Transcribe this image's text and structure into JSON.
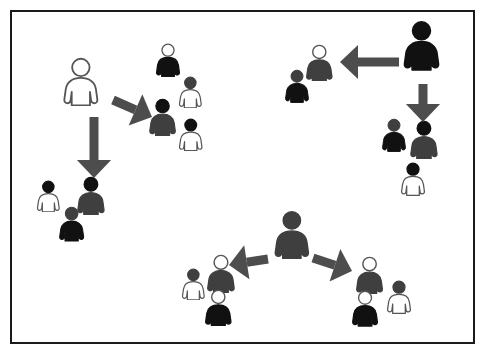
{
  "figure": {
    "canvas": {
      "width": 485,
      "height": 356,
      "background": "#ffffff"
    },
    "frame": {
      "label": "diagram-border",
      "x": 10,
      "y": 10,
      "width": 465,
      "height": 334,
      "border_color": "#1a1a1a",
      "border_width": 2,
      "fill": "#ffffff"
    },
    "palette": {
      "black": "#111111",
      "dark_gray": "#3f3f3f",
      "mid_gray": "#555555",
      "white_fill": "#ffffff",
      "outline": "#555555",
      "arrow": "#4d4d4d"
    },
    "legend_note": "Person icons vary by head color and body color: black, gray, or white (outlined).",
    "people": [
      {
        "id": "p01",
        "name": "hub-person-top-left",
        "group": "top-left-hub",
        "x": 62,
        "y": 57,
        "scale": 1.45,
        "head": "white",
        "body": "white",
        "role": "hub"
      },
      {
        "id": "p02",
        "name": "person-top-mid-a",
        "group": "top-mid-cluster",
        "x": 155,
        "y": 43,
        "scale": 1.0,
        "head": "white",
        "body": "black",
        "role": "member"
      },
      {
        "id": "p03",
        "name": "person-top-mid-b",
        "group": "top-mid-cluster",
        "x": 178,
        "y": 76,
        "scale": 0.95,
        "head": "gray",
        "body": "white",
        "role": "member"
      },
      {
        "id": "p04",
        "name": "person-top-mid-c",
        "group": "top-mid-cluster",
        "x": 148,
        "y": 98,
        "scale": 1.12,
        "head": "black",
        "body": "gray",
        "role": "member"
      },
      {
        "id": "p05",
        "name": "person-top-mid-d",
        "group": "top-mid-cluster",
        "x": 178,
        "y": 118,
        "scale": 0.98,
        "head": "black",
        "body": "white",
        "role": "member"
      },
      {
        "id": "p06",
        "name": "person-left-low-a",
        "group": "left-low-cluster",
        "x": 36,
        "y": 180,
        "scale": 0.95,
        "head": "black",
        "body": "white",
        "role": "member"
      },
      {
        "id": "p07",
        "name": "person-left-low-b",
        "group": "left-low-cluster",
        "x": 76,
        "y": 176,
        "scale": 1.15,
        "head": "black",
        "body": "gray",
        "role": "member"
      },
      {
        "id": "p08",
        "name": "person-left-low-c",
        "group": "left-low-cluster",
        "x": 58,
        "y": 206,
        "scale": 1.05,
        "head": "gray",
        "body": "black",
        "role": "member"
      },
      {
        "id": "p09",
        "name": "hub-person-top-right",
        "group": "top-right-hub",
        "x": 402,
        "y": 20,
        "scale": 1.5,
        "head": "black",
        "body": "black",
        "role": "hub"
      },
      {
        "id": "p10",
        "name": "person-top-right-a",
        "group": "top-right-cluster",
        "x": 305,
        "y": 44,
        "scale": 1.1,
        "head": "white",
        "body": "gray",
        "role": "member"
      },
      {
        "id": "p11",
        "name": "person-top-right-b",
        "group": "top-right-cluster",
        "x": 284,
        "y": 69,
        "scale": 1.0,
        "head": "gray",
        "body": "black",
        "role": "member"
      },
      {
        "id": "p12",
        "name": "person-right-mid-a",
        "group": "right-mid-cluster",
        "x": 381,
        "y": 118,
        "scale": 1.0,
        "head": "gray",
        "body": "black",
        "role": "member"
      },
      {
        "id": "p13",
        "name": "person-right-mid-b",
        "group": "right-mid-cluster",
        "x": 409,
        "y": 120,
        "scale": 1.15,
        "head": "black",
        "body": "gray",
        "role": "member"
      },
      {
        "id": "p14",
        "name": "person-right-mid-c",
        "group": "right-mid-cluster",
        "x": 400,
        "y": 162,
        "scale": 1.0,
        "head": "black",
        "body": "white",
        "role": "member"
      },
      {
        "id": "p15",
        "name": "hub-person-bottom-center",
        "group": "bottom-center-hub",
        "x": 273,
        "y": 210,
        "scale": 1.45,
        "head": "gray",
        "body": "gray",
        "role": "hub"
      },
      {
        "id": "p16",
        "name": "person-bottom-left-a",
        "group": "bottom-left-cluster",
        "x": 181,
        "y": 268,
        "scale": 0.95,
        "head": "gray",
        "body": "white",
        "role": "member"
      },
      {
        "id": "p17",
        "name": "person-bottom-left-b",
        "group": "bottom-left-cluster",
        "x": 206,
        "y": 254,
        "scale": 1.15,
        "head": "white",
        "body": "gray",
        "role": "member"
      },
      {
        "id": "p18",
        "name": "person-bottom-left-c",
        "group": "bottom-left-cluster",
        "x": 204,
        "y": 289,
        "scale": 1.1,
        "head": "white",
        "body": "black",
        "role": "member"
      },
      {
        "id": "p19",
        "name": "person-bottom-right-a",
        "group": "bottom-right-cluster",
        "x": 355,
        "y": 256,
        "scale": 1.12,
        "head": "white",
        "body": "gray",
        "role": "member"
      },
      {
        "id": "p20",
        "name": "person-bottom-right-b",
        "group": "bottom-right-cluster",
        "x": 386,
        "y": 280,
        "scale": 1.0,
        "head": "gray",
        "body": "white",
        "role": "member"
      },
      {
        "id": "p21",
        "name": "person-bottom-right-c",
        "group": "bottom-right-cluster",
        "x": 351,
        "y": 290,
        "scale": 1.08,
        "head": "white",
        "body": "black",
        "role": "member"
      }
    ],
    "arrows": [
      {
        "id": "a1",
        "name": "arrow-top-left-to-top-mid",
        "from": "hub-person-top-left",
        "to": "top-mid-cluster",
        "x1": 113,
        "y1": 100,
        "x2": 152,
        "y2": 117,
        "width": 9,
        "head": 18,
        "direction": "down-right"
      },
      {
        "id": "a2",
        "name": "arrow-top-left-to-left-low",
        "from": "hub-person-top-left",
        "to": "left-low-cluster",
        "x1": 94,
        "y1": 117,
        "x2": 94,
        "y2": 178,
        "width": 9,
        "head": 18,
        "direction": "down"
      },
      {
        "id": "a3",
        "name": "arrow-top-right-to-top-right-cluster",
        "from": "hub-person-top-right",
        "to": "top-right-cluster",
        "x1": 399,
        "y1": 62,
        "x2": 340,
        "y2": 62,
        "width": 9,
        "head": 18,
        "direction": "left"
      },
      {
        "id": "a4",
        "name": "arrow-top-right-to-right-mid",
        "from": "hub-person-top-right",
        "to": "right-mid-cluster",
        "x1": 423,
        "y1": 84,
        "x2": 423,
        "y2": 122,
        "width": 9,
        "head": 18,
        "direction": "down"
      },
      {
        "id": "a5",
        "name": "arrow-bottom-center-to-bottom-left",
        "from": "hub-person-bottom-center",
        "to": "bottom-left-cluster",
        "x1": 268,
        "y1": 259,
        "x2": 229,
        "y2": 265,
        "width": 9,
        "head": 18,
        "direction": "left"
      },
      {
        "id": "a6",
        "name": "arrow-bottom-center-to-bottom-right",
        "from": "hub-person-bottom-center",
        "to": "bottom-right-cluster",
        "x1": 313,
        "y1": 258,
        "x2": 352,
        "y2": 271,
        "width": 9,
        "head": 18,
        "direction": "down-right"
      }
    ]
  }
}
